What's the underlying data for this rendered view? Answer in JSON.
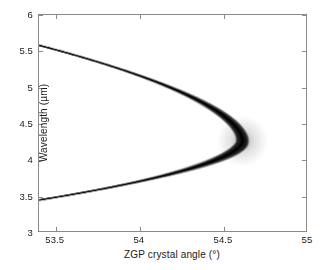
{
  "figure": {
    "background_color": "#ffffff",
    "axis_color": "#8a8a8a",
    "curve_color": "#000000"
  },
  "chart_data": {
    "type": "line",
    "title": "",
    "subtitle": "",
    "xlabel": "ZGP crystal angle (°)",
    "ylabel": "Wavelength (µm)",
    "xlim": [
      53.4,
      55.0
    ],
    "ylim": [
      3.0,
      6.0
    ],
    "xticks": [
      53.5,
      54.0,
      54.5,
      55.0
    ],
    "xticklabels": [
      "53.5",
      "54",
      "54.5",
      "55"
    ],
    "yticks": [
      3.0,
      3.5,
      4.0,
      4.5,
      5.0,
      5.5,
      6.0
    ],
    "yticklabels": [
      "3",
      "3.5",
      "4",
      "4.5",
      "5",
      "5.5",
      "6"
    ],
    "grid": false,
    "legend": null,
    "annotations": [],
    "render_style": "blurred-intensity-band",
    "vertex": [
      54.62,
      4.25
    ],
    "series": [
      {
        "name": "signal-branch",
        "description": "upper (signal) phase-matching branch",
        "x": [
          53.4,
          53.45,
          53.5,
          53.55,
          53.6,
          53.65,
          53.7,
          53.75,
          53.8,
          53.85,
          53.9,
          53.95,
          54.0,
          54.05,
          54.1,
          54.15,
          54.2,
          54.25,
          54.3,
          54.35,
          54.4,
          54.45,
          54.5,
          54.55,
          54.58,
          54.6,
          54.62
        ],
        "y": [
          5.58,
          5.54,
          5.5,
          5.46,
          5.41,
          5.37,
          5.32,
          5.27,
          5.22,
          5.17,
          5.12,
          5.06,
          5.0,
          4.94,
          4.88,
          4.81,
          4.74,
          4.67,
          4.59,
          4.51,
          4.42,
          4.32,
          4.21,
          4.33,
          4.3,
          4.28,
          4.25
        ]
      },
      {
        "name": "idler-branch",
        "description": "lower (idler) phase-matching branch",
        "x": [
          53.4,
          53.45,
          53.5,
          53.55,
          53.6,
          53.65,
          53.7,
          53.75,
          53.8,
          53.85,
          53.9,
          53.95,
          54.0,
          54.05,
          54.1,
          54.15,
          54.2,
          54.25,
          54.3,
          54.35,
          54.4,
          54.45,
          54.5,
          54.55,
          54.58,
          54.6,
          54.62
        ],
        "y": [
          3.43,
          3.44,
          3.45,
          3.46,
          3.48,
          3.49,
          3.51,
          3.52,
          3.54,
          3.56,
          3.58,
          3.6,
          3.62,
          3.64,
          3.67,
          3.69,
          3.72,
          3.75,
          3.79,
          3.82,
          3.86,
          3.91,
          3.96,
          4.04,
          4.1,
          4.15,
          4.25
        ]
      }
    ]
  }
}
